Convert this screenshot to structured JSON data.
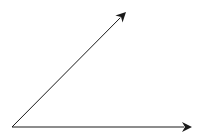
{
  "diagram": {
    "type": "angle",
    "background": "#ffffff",
    "stroke_color": "#1a1a1a",
    "vertex": {
      "x": 12,
      "y": 127
    },
    "rays": [
      {
        "name": "diagonal-ray",
        "from": {
          "x": 12,
          "y": 127
        },
        "to": {
          "x": 126,
          "y": 12
        }
      },
      {
        "name": "horizontal-ray",
        "from": {
          "x": 12,
          "y": 127
        },
        "to": {
          "x": 192,
          "y": 127
        }
      }
    ]
  }
}
